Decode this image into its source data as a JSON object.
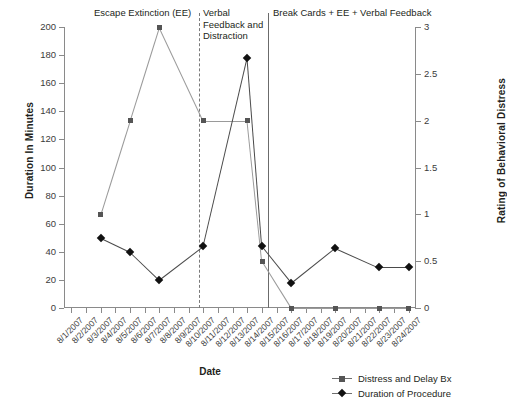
{
  "chart_data": {
    "type": "line",
    "title": "",
    "xlabel": "Date",
    "ylabel": "Duration In Minutes",
    "ylabel_secondary": "Rating of Behavioral Distress",
    "ylim": [
      0,
      200
    ],
    "ylim_secondary": [
      0,
      3
    ],
    "yticks": [
      0,
      20,
      40,
      60,
      80,
      100,
      120,
      140,
      160,
      180,
      200
    ],
    "yticks_secondary": [
      "0",
      "0.5",
      "1",
      "1.5",
      "2",
      "2.5",
      "3"
    ],
    "grid": false,
    "legend_position": "bottom-right",
    "categories": [
      "8/1/2007",
      "8/2/2007",
      "8/3/2007",
      "8/4/2007",
      "8/5/2007",
      "8/6/2007",
      "8/7/2007",
      "8/8/2007",
      "8/9/2007",
      "8/10/2007",
      "8/11/2007",
      "8/12/2007",
      "8/13/2007",
      "8/14/2007",
      "8/15/2007",
      "8/16/2007",
      "8/17/2007",
      "8/18/2007",
      "8/19/2007",
      "8/20/2007",
      "8/21/2007",
      "8/22/2007",
      "8/23/2007",
      "8/24/2007"
    ],
    "series": [
      {
        "name": "Distress and Delay Bx",
        "axis": "secondary",
        "marker": "square",
        "color": "#555555",
        "points": [
          {
            "x": "8/3/2007",
            "value": 1.0
          },
          {
            "x": "8/5/2007",
            "value": 2.0
          },
          {
            "x": "8/7/2007",
            "value": 3.0
          },
          {
            "x": "8/10/2007",
            "value": 2.0
          },
          {
            "x": "8/13/2007",
            "value": 2.0
          },
          {
            "x": "8/14/2007",
            "value": 0.5
          },
          {
            "x": "8/16/2007",
            "value": 0.0
          },
          {
            "x": "8/19/2007",
            "value": 0.0
          },
          {
            "x": "8/22/2007",
            "value": 0.0
          },
          {
            "x": "8/24/2007",
            "value": 0.0
          }
        ]
      },
      {
        "name": "Duration of Procedure",
        "axis": "primary",
        "marker": "diamond",
        "color": "#111111",
        "points": [
          {
            "x": "8/3/2007",
            "value": 50
          },
          {
            "x": "8/5/2007",
            "value": 40
          },
          {
            "x": "8/7/2007",
            "value": 20
          },
          {
            "x": "8/10/2007",
            "value": 44
          },
          {
            "x": "8/13/2007",
            "value": 178
          },
          {
            "x": "8/14/2007",
            "value": 44
          },
          {
            "x": "8/16/2007",
            "value": 18
          },
          {
            "x": "8/19/2007",
            "value": 43
          },
          {
            "x": "8/22/2007",
            "value": 29
          },
          {
            "x": "8/24/2007",
            "value": 29
          }
        ]
      }
    ],
    "phases": [
      {
        "label": "Escape Extinction (EE)",
        "separator": "none"
      },
      {
        "label": "Verbal Feedback and Distraction",
        "separator": "dashed"
      },
      {
        "label": "Break Cards + EE + Verbal Feedback",
        "separator": "solid"
      }
    ]
  },
  "legend": {
    "entries": [
      {
        "label": "Distress and Delay Bx",
        "marker": "square"
      },
      {
        "label": "Duration of Procedure",
        "marker": "diamond"
      }
    ]
  }
}
